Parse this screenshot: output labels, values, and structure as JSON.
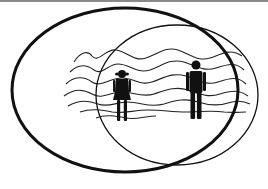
{
  "diagram": {
    "colors": {
      "stroke": "#111111",
      "background": "#ffffff",
      "top_rule": "#8a8a8a"
    },
    "shapes": {
      "large_ellipse": {
        "cx": 125,
        "cy": 90,
        "rx": 113,
        "ry": 82,
        "stroke_width": 3
      },
      "small_ellipse": {
        "cx": 177,
        "cy": 95,
        "rx": 81,
        "ry": 70,
        "stroke_width": 1.3
      }
    },
    "figures": [
      {
        "type": "woman",
        "x": 122,
        "y_top": 70,
        "y_bottom": 121
      },
      {
        "type": "man",
        "x": 196,
        "y_top": 60,
        "y_bottom": 119
      }
    ],
    "wavy_lines_count": 7,
    "labels": []
  }
}
